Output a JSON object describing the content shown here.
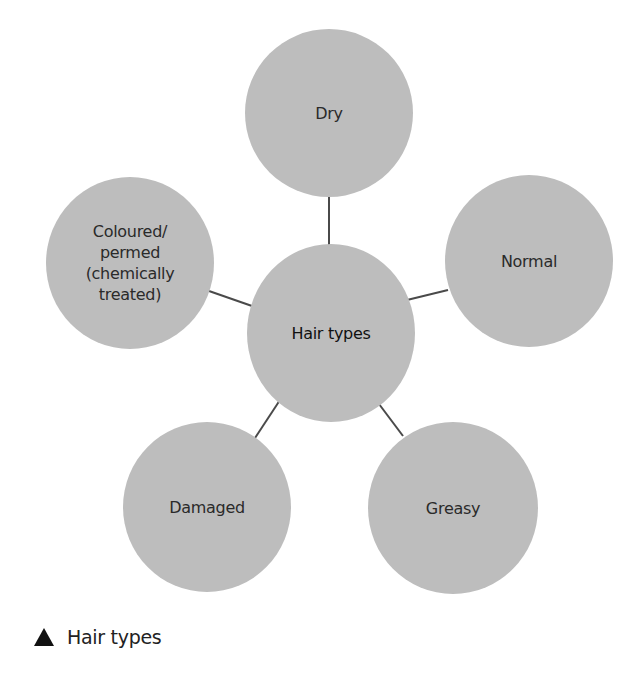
{
  "diagram": {
    "center": {
      "label": "Hair types"
    },
    "nodes": [
      {
        "label": "Dry"
      },
      {
        "label": "Normal"
      },
      {
        "label": "Greasy"
      },
      {
        "label": "Damaged"
      },
      {
        "label": "Coloured/ permed (chemically treated)"
      }
    ],
    "colors": {
      "node_fill": "#bdbdbd",
      "line": "#4a4a4a"
    }
  },
  "caption": {
    "icon": "triangle-up-icon",
    "text": "Hair types"
  }
}
